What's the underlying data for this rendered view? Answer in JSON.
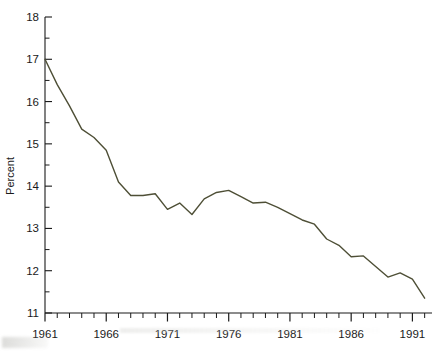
{
  "chart_data": {
    "type": "line",
    "title": "",
    "xlabel": "",
    "ylabel": "Percent",
    "xlim": [
      1961,
      1992.6
    ],
    "ylim": [
      11,
      18
    ],
    "grid": false,
    "legend": null,
    "y_ticks_major": [
      11,
      12,
      13,
      14,
      15,
      16,
      17,
      18
    ],
    "y_ticks_minor": [
      11.5,
      12.5,
      13.5,
      14.5,
      15.5,
      16.5,
      17.5
    ],
    "y_tick_labels": [
      "11",
      "12",
      "13",
      "14",
      "15",
      "16",
      "17",
      "18"
    ],
    "x_ticks_major": [
      1961,
      1966,
      1971,
      1976,
      1981,
      1986,
      1991
    ],
    "x_tick_labels": [
      "1961",
      "1966",
      "1971",
      "1976",
      "1981",
      "1986",
      "1991"
    ],
    "x_ticks_minor": [
      1962,
      1963,
      1964,
      1965,
      1967,
      1968,
      1969,
      1970,
      1972,
      1973,
      1974,
      1975,
      1977,
      1978,
      1979,
      1980,
      1982,
      1983,
      1984,
      1985,
      1987,
      1988,
      1989,
      1990,
      1992
    ],
    "line_color": "#4e4f36",
    "line_width": 1.4,
    "x": [
      1961,
      1962,
      1963,
      1964,
      1965,
      1966,
      1967,
      1968,
      1969,
      1970,
      1971,
      1972,
      1973,
      1974,
      1975,
      1976,
      1977,
      1978,
      1979,
      1980,
      1981,
      1982,
      1983,
      1984,
      1985,
      1986,
      1987,
      1988,
      1989,
      1990,
      1991,
      1992
    ],
    "values": [
      17.0,
      16.4,
      15.9,
      15.35,
      15.15,
      14.85,
      14.1,
      13.78,
      13.78,
      13.82,
      13.45,
      13.6,
      13.33,
      13.7,
      13.85,
      13.9,
      13.75,
      13.6,
      13.62,
      13.5,
      13.35,
      13.2,
      13.1,
      12.75,
      12.6,
      12.33,
      12.35,
      12.1,
      11.85,
      11.95,
      11.8,
      11.35
    ],
    "series": [
      {
        "name": "Percent",
        "values": [
          17.0,
          16.4,
          15.9,
          15.35,
          15.15,
          14.85,
          14.1,
          13.78,
          13.78,
          13.82,
          13.45,
          13.6,
          13.33,
          13.7,
          13.85,
          13.9,
          13.75,
          13.6,
          13.62,
          13.5,
          13.35,
          13.2,
          13.1,
          12.75,
          12.6,
          12.33,
          12.35,
          12.1,
          11.85,
          11.95,
          11.8,
          11.35
        ]
      }
    ]
  }
}
